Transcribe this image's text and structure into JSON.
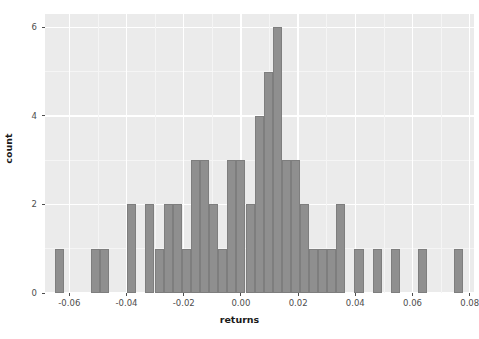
{
  "chart_data": {
    "type": "bar",
    "subtype": "histogram",
    "title": "",
    "xlabel": "returns",
    "ylabel": "count",
    "xlim": [
      -0.0685,
      0.0815
    ],
    "ylim": [
      0,
      6.3
    ],
    "xticks": [
      -0.06,
      -0.04,
      -0.02,
      0.0,
      0.02,
      0.04,
      0.06,
      0.08
    ],
    "xtick_labels": [
      "-0.06",
      "-0.04",
      "-0.02",
      "0.00",
      "0.02",
      "0.04",
      "0.06",
      "0.08"
    ],
    "yticks": [
      0,
      2,
      4,
      6
    ],
    "ytick_labels": [
      "0",
      "2",
      "4",
      "6"
    ],
    "grid": true,
    "legend": "none",
    "binwidth": 0.003175,
    "bar_color": "#8f8f8f",
    "bar_edge_color": "#7e7e7e",
    "panel_background": "#ebebeb",
    "gridline_color": "#ffffff",
    "bin_centers": [
      -0.0635,
      -0.0603,
      -0.0572,
      -0.054,
      -0.0508,
      -0.0476,
      -0.0445,
      -0.0413,
      -0.0381,
      -0.0349,
      -0.0318,
      -0.0286,
      -0.0254,
      -0.0222,
      -0.0191,
      -0.0159,
      -0.0127,
      -0.0095,
      -0.0064,
      -0.0032,
      0.0,
      0.0032,
      0.0064,
      0.0095,
      0.0127,
      0.0159,
      0.0191,
      0.0222,
      0.0254,
      0.0286,
      0.0318,
      0.0349,
      0.0381,
      0.0413,
      0.0445,
      0.0476,
      0.0508,
      0.054,
      0.0572,
      0.0603,
      0.0635,
      0.0667,
      0.0699,
      0.073,
      0.0762
    ],
    "values": [
      1,
      0,
      0,
      0,
      1,
      1,
      0,
      0,
      2,
      0,
      2,
      1,
      2,
      2,
      1,
      3,
      3,
      2,
      1,
      3,
      3,
      2,
      4,
      5,
      6,
      3,
      3,
      2,
      1,
      1,
      1,
      2,
      0,
      1,
      0,
      1,
      0,
      1,
      0,
      0,
      1,
      0,
      0,
      0,
      1
    ],
    "max_count": 6,
    "n_bins": 45
  },
  "axis": {
    "x_title": "returns",
    "y_title": "count"
  }
}
